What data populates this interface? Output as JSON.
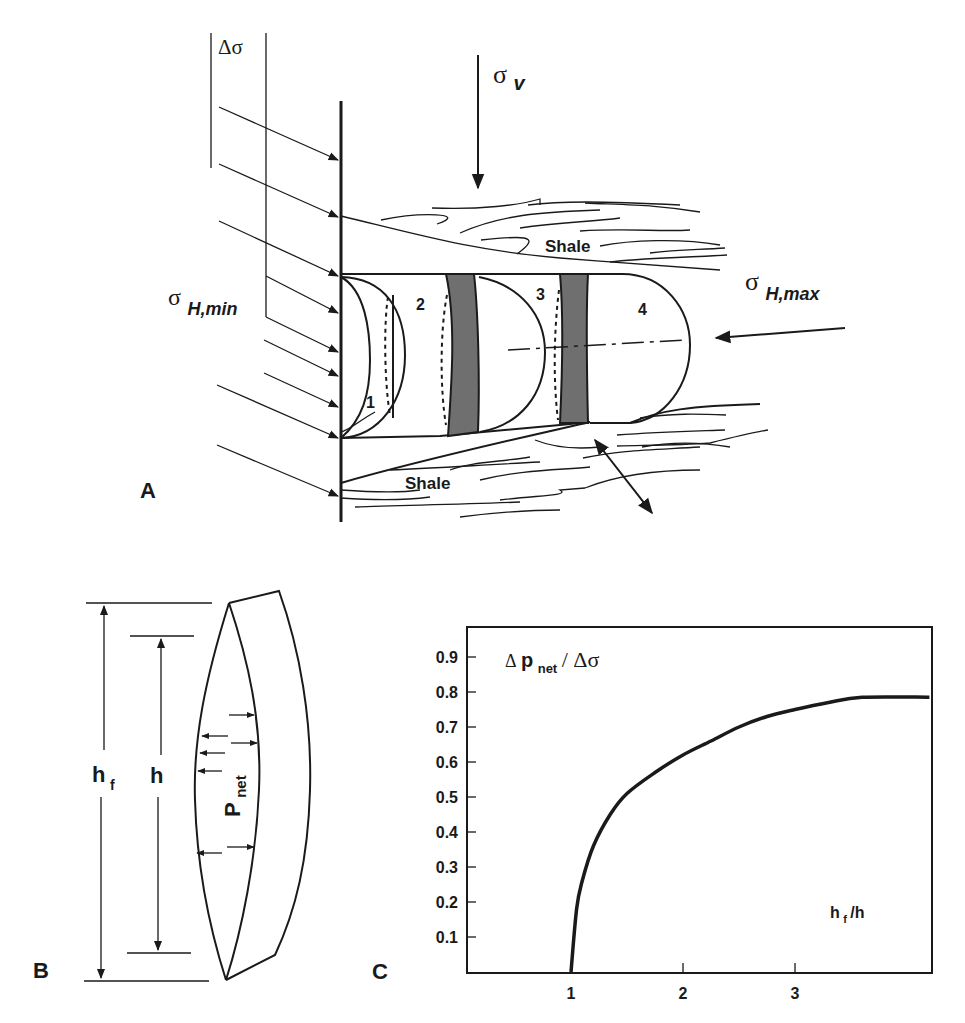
{
  "panels": {
    "a": {
      "letter": "A",
      "delta_sigma": "Δσ",
      "sigma_v": {
        "symbol": "σ",
        "subscript": "v"
      },
      "sigma_h_min": {
        "symbol": "σ",
        "subscript": "H,min"
      },
      "sigma_h_max": {
        "symbol": "σ",
        "subscript": "H,max"
      },
      "shale_upper": "Shale",
      "shale_lower": "Shale",
      "stages": [
        "1",
        "2",
        "3",
        "4"
      ],
      "band_color": "#6f6f6f"
    },
    "b": {
      "letter": "B",
      "hf": {
        "main": "h",
        "sub": "f"
      },
      "h": "h",
      "pnet": {
        "main": "P",
        "sub": "net"
      }
    },
    "c": {
      "letter": "C",
      "ylabel": {
        "delta": "Δ",
        "p": "p",
        "sub": "net",
        "rest": " / Δσ"
      },
      "xlabel": {
        "main": "h",
        "sub": "f",
        "rest": "/h"
      }
    }
  },
  "chart_data": {
    "type": "line",
    "title": "",
    "xlabel": "hf/h",
    "ylabel": "Δpnet / Δσ",
    "x_ticks": [
      "1",
      "2",
      "3"
    ],
    "y_ticks": [
      "0.1",
      "0.2",
      "0.3",
      "0.4",
      "0.5",
      "0.6",
      "0.7",
      "0.8",
      "0.9"
    ],
    "xlim": [
      0.07,
      4.2
    ],
    "ylim": [
      0,
      0.98
    ],
    "grid": false,
    "legend": null,
    "series": [
      {
        "name": "Δpnet/Δσ vs hf/h",
        "x": [
          1.0,
          1.05,
          1.1,
          1.2,
          1.35,
          1.5,
          1.75,
          2.0,
          2.25,
          2.5,
          2.75,
          3.0,
          3.3,
          3.6,
          4.2
        ],
        "y": [
          0.0,
          0.18,
          0.26,
          0.36,
          0.45,
          0.51,
          0.57,
          0.62,
          0.66,
          0.7,
          0.73,
          0.75,
          0.77,
          0.785,
          0.785
        ]
      }
    ]
  }
}
